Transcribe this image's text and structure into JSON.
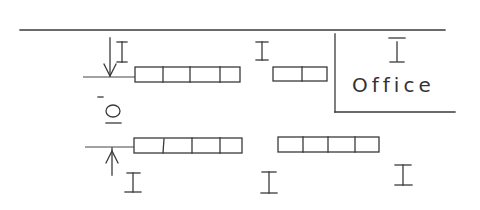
{
  "diagram": {
    "type": "floor-plan-schematic",
    "ink_color": "#3a3a3a",
    "background": "#ffffff",
    "room_label": "Office",
    "symbols": {
      "i_beam": "I",
      "dimension_label": "O"
    },
    "rows": [
      {
        "name": "row-1",
        "benches": [
          {
            "name": "bench-row1-left",
            "cells": 4
          },
          {
            "name": "bench-row1-right",
            "cells": 2
          }
        ]
      },
      {
        "name": "row-2",
        "benches": [
          {
            "name": "bench-row2-left",
            "cells": 4
          },
          {
            "name": "bench-row2-right",
            "cells": 4
          }
        ]
      }
    ],
    "markers": [
      {
        "name": "i-beam-top-left",
        "glyph": "I"
      },
      {
        "name": "i-beam-top-middle",
        "glyph": "I"
      },
      {
        "name": "i-beam-office",
        "glyph": "I"
      },
      {
        "name": "i-beam-bottom-left",
        "glyph": "I"
      },
      {
        "name": "i-beam-bottom-middle",
        "glyph": "I"
      },
      {
        "name": "i-beam-bottom-right",
        "glyph": "I"
      }
    ],
    "dimension": {
      "label": "O",
      "arrows": [
        "down-arrow",
        "up-arrow"
      ]
    }
  }
}
